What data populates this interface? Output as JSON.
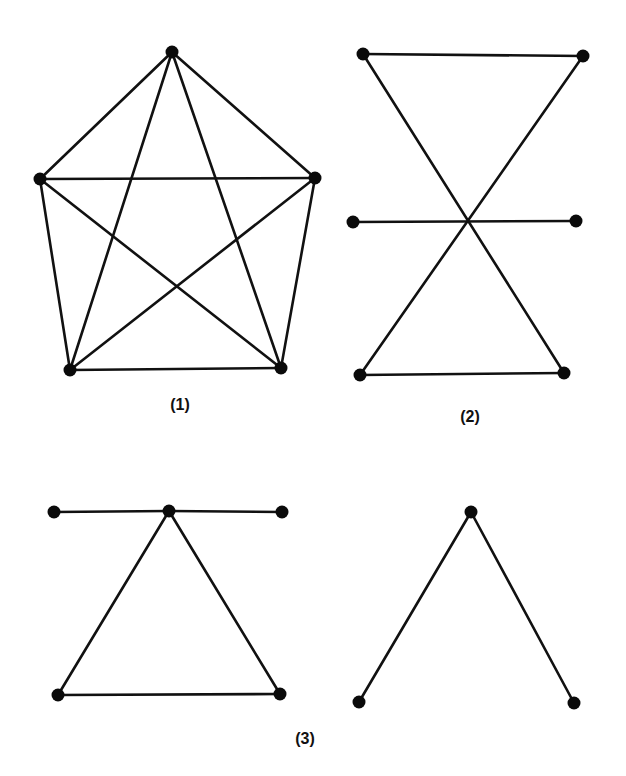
{
  "figures": [
    {
      "label": "(1)",
      "label_pos": [
        180,
        396
      ],
      "nodes": [
        [
          172,
          52
        ],
        [
          40,
          179
        ],
        [
          315,
          178
        ],
        [
          70,
          370
        ],
        [
          281,
          368
        ]
      ],
      "edges": [
        [
          0,
          1
        ],
        [
          0,
          2
        ],
        [
          0,
          3
        ],
        [
          0,
          4
        ],
        [
          1,
          2
        ],
        [
          1,
          3
        ],
        [
          1,
          4
        ],
        [
          2,
          3
        ],
        [
          2,
          4
        ],
        [
          3,
          4
        ]
      ]
    },
    {
      "label": "(2)",
      "label_pos": [
        470,
        408
      ],
      "nodes": [
        [
          363,
          54
        ],
        [
          583,
          56
        ],
        [
          353,
          222
        ],
        [
          576,
          221
        ],
        [
          360,
          375
        ],
        [
          564,
          373
        ]
      ],
      "edges": [
        [
          0,
          1
        ],
        [
          0,
          5
        ],
        [
          1,
          4
        ],
        [
          2,
          3
        ],
        [
          4,
          5
        ]
      ]
    },
    {
      "label": "(3)",
      "label_pos": [
        305,
        730
      ],
      "nodes": [
        [
          54,
          512
        ],
        [
          169,
          511
        ],
        [
          282,
          512
        ],
        [
          58,
          695
        ],
        [
          280,
          694
        ],
        [
          471,
          512
        ],
        [
          359,
          702
        ],
        [
          574,
          703
        ]
      ],
      "edges": [
        [
          0,
          1
        ],
        [
          1,
          2
        ],
        [
          1,
          3
        ],
        [
          1,
          4
        ],
        [
          3,
          4
        ],
        [
          5,
          6
        ],
        [
          5,
          7
        ]
      ]
    }
  ]
}
